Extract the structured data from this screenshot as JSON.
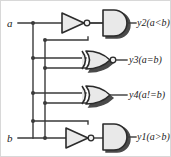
{
  "figure": {
    "colors": {
      "wire": "#3a3a3a",
      "gate_fill": "#e9e9e9",
      "gate_stroke": "#2b2b2b",
      "gate_shadow": "#2b2b2b",
      "frame": "#d8d8d8",
      "background": "#ffffff",
      "text": "#1a1a1a"
    }
  },
  "inputs": [
    {
      "name": "input-a",
      "label": "a"
    },
    {
      "name": "input-b",
      "label": "b"
    }
  ],
  "gates": [
    {
      "id": "inv-top",
      "type": "inverter",
      "icon": "not-gate-icon"
    },
    {
      "id": "and-top",
      "type": "and",
      "icon": "and-gate-icon"
    },
    {
      "id": "xnor-mid",
      "type": "xnor",
      "icon": "xnor-gate-icon"
    },
    {
      "id": "xor-mid",
      "type": "xor",
      "icon": "xor-gate-icon"
    },
    {
      "id": "inv-bot",
      "type": "inverter",
      "icon": "not-gate-icon"
    },
    {
      "id": "and-bot",
      "type": "and",
      "icon": "and-gate-icon"
    }
  ],
  "outputs": [
    {
      "id": "y2",
      "label": "y2(a<b)",
      "gate": "and-top"
    },
    {
      "id": "y3",
      "label": "y3(a=b)",
      "gate": "xnor-mid"
    },
    {
      "id": "y4",
      "label": "y4(a!=b)",
      "gate": "xor-mid"
    },
    {
      "id": "y1",
      "label": "y1(a>b)",
      "gate": "and-bot"
    }
  ]
}
